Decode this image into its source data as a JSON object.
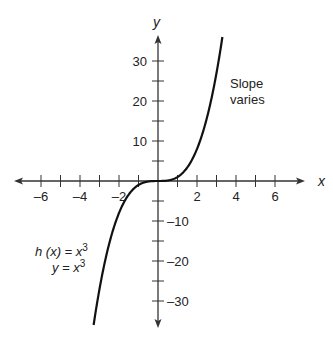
{
  "chart_data": {
    "type": "line",
    "title": "",
    "xlabel": "x",
    "ylabel": "y",
    "xlim": [
      -7,
      7
    ],
    "ylim": [
      -36,
      36
    ],
    "x_ticks": [
      -6,
      -5,
      -4,
      -3,
      -2,
      -1,
      1,
      2,
      3,
      4,
      5,
      6
    ],
    "x_tick_labels": [
      "-6",
      "-4",
      "-2",
      "2",
      "4",
      "6"
    ],
    "x_tick_label_values": [
      -6,
      -4,
      -2,
      2,
      4,
      6
    ],
    "y_ticks": [
      -30,
      -25,
      -20,
      -15,
      -10,
      -5,
      5,
      10,
      15,
      20,
      25,
      30
    ],
    "y_tick_labels": [
      "30",
      "20",
      "10",
      "-10",
      "-20",
      "-30"
    ],
    "y_tick_label_values": [
      30,
      20,
      10,
      -10,
      -20,
      -30
    ],
    "grid": false,
    "series": [
      {
        "name": "h(x) = x^3",
        "function": "x^3",
        "x": [
          -3.25,
          -3,
          -2.5,
          -2,
          -1.5,
          -1,
          -0.5,
          0,
          0.5,
          1,
          1.5,
          2,
          2.5,
          3,
          3.25
        ],
        "values": [
          -34.3,
          -27,
          -15.6,
          -8,
          -3.4,
          -1,
          -0.1,
          0,
          0.1,
          1,
          3.4,
          8,
          15.6,
          27,
          34.3
        ]
      }
    ],
    "annotations": [
      {
        "text": "Slope",
        "line2": "varies",
        "x": 4,
        "y": 23
      },
      {
        "text": "h (x) = x³",
        "line2": "y = x³",
        "x": -4,
        "y": -15
      }
    ]
  },
  "labels": {
    "x_axis": "x",
    "y_axis": "y",
    "slope_line1": "Slope",
    "slope_line2": "varies",
    "eq_line1_pre": "h (",
    "eq_line1_var": "x",
    "eq_line1_post": ") = x",
    "eq_line2": "y = x",
    "superscript": "3"
  }
}
